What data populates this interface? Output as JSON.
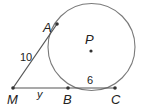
{
  "diagram": {
    "type": "geometry",
    "circle": {
      "label": "P",
      "cx": 91.5,
      "cy": 47,
      "r": 43.5,
      "stroke": "#777777"
    },
    "points": {
      "M": {
        "label": "M",
        "x": 13,
        "y": 88
      },
      "A": {
        "label": "A",
        "x": 57,
        "y": 24
      },
      "B": {
        "label": "B",
        "x": 68,
        "y": 88
      },
      "C": {
        "label": "C",
        "x": 115,
        "y": 88
      },
      "P": {
        "label": "P",
        "x": 91,
        "y": 51
      }
    },
    "segments": [
      {
        "from": "M",
        "to": "A",
        "length_label": "10"
      },
      {
        "from": "M",
        "to": "B",
        "length_label": "y"
      },
      {
        "from": "B",
        "to": "C",
        "length_label": "6"
      }
    ],
    "labels": {
      "A": "A",
      "P": "P",
      "M": "M",
      "B": "B",
      "C": "C",
      "MA_length": "10",
      "BC_length": "6",
      "MB_length": "y"
    },
    "colors": {
      "line": "#555555",
      "circle": "#777777",
      "point": "#333333",
      "text": "#222222"
    }
  }
}
